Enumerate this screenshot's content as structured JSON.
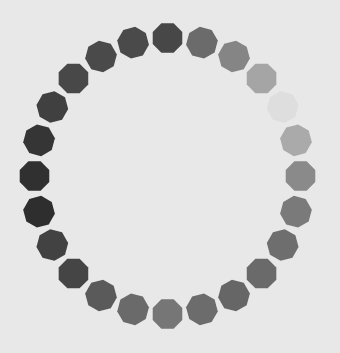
{
  "spinner": {
    "type": "loading-spinner",
    "segment_count": 24,
    "segment_shape": "octagon",
    "background_color": "#e8e8e8",
    "segments": [
      {
        "color": "#474747"
      },
      {
        "color": "#6b6b6b"
      },
      {
        "color": "#858585"
      },
      {
        "color": "#a5a5a5"
      },
      {
        "color": "#dedede"
      },
      {
        "color": "#aaaaaa"
      },
      {
        "color": "#8a8a8a"
      },
      {
        "color": "#7a7a7a"
      },
      {
        "color": "#6e6e6e"
      },
      {
        "color": "#6a6a6a"
      },
      {
        "color": "#666666"
      },
      {
        "color": "#6c6c6c"
      },
      {
        "color": "#767676"
      },
      {
        "color": "#6a6a6a"
      },
      {
        "color": "#5a5a5a"
      },
      {
        "color": "#454545"
      },
      {
        "color": "#424242"
      },
      {
        "color": "#2e2e2e"
      },
      {
        "color": "#303030"
      },
      {
        "color": "#353535"
      },
      {
        "color": "#404040"
      },
      {
        "color": "#484848"
      },
      {
        "color": "#4a4a4a"
      },
      {
        "color": "#4a4a4a"
      }
    ]
  }
}
